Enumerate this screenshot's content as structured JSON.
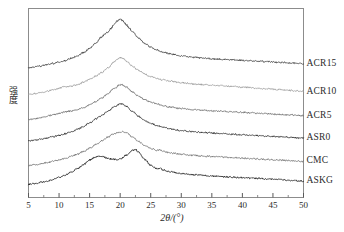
{
  "chart_data": {
    "type": "line",
    "title": "",
    "xlabel": "2θ/(°)",
    "ylabel": "强度",
    "xlim": [
      5,
      50
    ],
    "ylim": [
      0,
      100
    ],
    "grid": false,
    "legend_position": "right-of-axes-inline",
    "xticks": [
      5,
      10,
      15,
      20,
      25,
      30,
      35,
      40,
      45,
      50
    ],
    "xtick_labels": [
      "5",
      "10",
      "15",
      "20",
      "25",
      "30",
      "35",
      "40",
      "45",
      "50"
    ],
    "minor_ticks_per_interval": 1,
    "yticks": [],
    "ytick_labels": [],
    "note": "Stacked XRD diffractograms, intensity offset vertically; y-axis unlabeled (arbitrary units)",
    "series": [
      {
        "name": "ACR15",
        "color": "#3d3d3d",
        "offset": 72,
        "peak_2theta": 20.0,
        "shoulder_2theta": 17.5,
        "x": [
          5,
          6,
          7,
          8,
          9,
          10,
          11,
          12,
          13,
          14,
          15,
          16,
          17,
          17.5,
          18,
          18.5,
          19,
          19.5,
          20,
          20.5,
          21,
          21.5,
          22,
          23,
          24,
          25,
          26,
          27,
          28,
          30,
          32,
          34,
          36,
          38,
          40,
          42,
          44,
          46,
          48,
          50
        ],
        "values": [
          4,
          4.6,
          5.2,
          6,
          6.8,
          7.6,
          8.6,
          10,
          11.6,
          13.6,
          16.2,
          19.5,
          23.4,
          25.2,
          26.6,
          28.6,
          31.2,
          33.4,
          34.6,
          33.2,
          31,
          28.8,
          26.6,
          22.6,
          19.4,
          17,
          15.2,
          13.9,
          12.9,
          11.5,
          10.6,
          10,
          9.5,
          9.1,
          8.7,
          8.3,
          7.9,
          7.5,
          7.1,
          6.6
        ]
      },
      {
        "name": "ACR10",
        "color": "#9a9a9a",
        "offset": 56,
        "peak_2theta": 20.0,
        "shoulder_2theta": 10.8,
        "x": [
          5,
          6,
          7,
          8,
          9,
          10,
          10.8,
          11.5,
          12,
          13,
          14,
          15,
          16,
          17,
          18,
          19,
          19.5,
          20,
          20.5,
          21,
          22,
          23,
          24,
          25,
          26,
          27,
          28,
          30,
          32,
          34,
          36,
          38,
          40,
          42,
          44,
          46,
          48,
          50
        ],
        "values": [
          3.4,
          4,
          4.6,
          5.4,
          6.2,
          7.2,
          8.2,
          8.4,
          8.6,
          9.6,
          11,
          12.8,
          14.8,
          17.2,
          20,
          23.6,
          25.4,
          26.6,
          25.8,
          24.2,
          21,
          18.4,
          16.2,
          14.6,
          13.4,
          12.5,
          11.8,
          10.8,
          10,
          9.4,
          8.9,
          8.4,
          7.9,
          7.4,
          6.9,
          6.4,
          5.9,
          5.3
        ]
      },
      {
        "name": "ACR5",
        "color": "#6b6b6b",
        "offset": 40,
        "peak_2theta": 20.2,
        "shoulder_2theta": 11.0,
        "x": [
          5,
          6,
          7,
          8,
          9,
          10,
          11,
          11.5,
          12,
          13,
          14,
          15,
          16,
          17,
          18,
          19,
          20,
          20.2,
          21,
          22,
          23,
          24,
          25,
          26,
          27,
          28,
          30,
          32,
          34,
          36,
          38,
          40,
          42,
          44,
          46,
          48,
          50
        ],
        "values": [
          3.6,
          4.2,
          4.9,
          5.7,
          6.6,
          7.6,
          8.6,
          8.8,
          9,
          9.9,
          11.2,
          12.8,
          14.8,
          17.2,
          20,
          23.2,
          25.4,
          25.6,
          24,
          21,
          18.4,
          16.2,
          14.6,
          13.4,
          12.4,
          11.6,
          10.6,
          9.9,
          9.4,
          9,
          8.6,
          8.2,
          7.8,
          7.4,
          7,
          6.6,
          6.1
        ]
      },
      {
        "name": "ASR0",
        "color": "#2e2e2e",
        "offset": 26,
        "peak_2theta": 20.4,
        "shoulder_2theta": 16.5,
        "x": [
          5,
          6,
          7,
          8,
          9,
          10,
          11,
          12,
          13,
          14,
          15,
          16,
          16.5,
          17,
          18,
          19,
          20,
          20.4,
          21,
          22,
          23,
          24,
          25,
          26,
          27,
          28,
          30,
          32,
          34,
          36,
          38,
          40,
          42,
          44,
          46,
          48,
          50
        ],
        "values": [
          4.2,
          4.8,
          5.4,
          6.2,
          7,
          7.9,
          8.9,
          10.1,
          11.6,
          13.4,
          15.6,
          18,
          19.2,
          20.4,
          23,
          25.6,
          27.4,
          27.6,
          26,
          22.8,
          19.8,
          17.2,
          15.4,
          14,
          12.9,
          12,
          10.9,
          10.1,
          9.5,
          9,
          8.6,
          8.2,
          7.8,
          7.4,
          7,
          6.6,
          6.1
        ]
      },
      {
        "name": "CMC",
        "color": "#707070",
        "offset": 12,
        "peak_2theta": 20.6,
        "shoulder_2theta": 16.0,
        "x": [
          5,
          6,
          7,
          8,
          9,
          10,
          11,
          12,
          13,
          14,
          15,
          16,
          17,
          18,
          19,
          20,
          20.6,
          21,
          22,
          23,
          24,
          25,
          26,
          26.5,
          27,
          28,
          30,
          32,
          34,
          36,
          38,
          40,
          42,
          44,
          46,
          48,
          50
        ],
        "values": [
          3,
          3.5,
          4.1,
          4.8,
          5.6,
          6.5,
          7.5,
          8.7,
          10.1,
          11.8,
          13.8,
          16,
          18.4,
          20.8,
          22.8,
          24,
          24.2,
          23.4,
          20.8,
          18,
          15.6,
          13.8,
          12.4,
          12.8,
          11.8,
          11,
          10,
          9.3,
          8.8,
          8.4,
          8,
          7.6,
          7.2,
          6.8,
          6.4,
          6,
          5.5
        ]
      },
      {
        "name": "ASKG",
        "color": "#1f1f1f",
        "offset": 0,
        "peak_2theta": 22.5,
        "second_peak_2theta": 16.5,
        "x": [
          5,
          6,
          7,
          8,
          9,
          10,
          11,
          12,
          13,
          14,
          15,
          16,
          16.5,
          17,
          18,
          19,
          19.5,
          20,
          21,
          22,
          22.5,
          23,
          24,
          25,
          26,
          26.5,
          27,
          28,
          30,
          32,
          34,
          36,
          38,
          40,
          42,
          44,
          46,
          48,
          50
        ],
        "values": [
          3.2,
          3.8,
          4.5,
          5.3,
          6.3,
          7.5,
          9,
          10.8,
          13,
          15.6,
          18.4,
          20.4,
          21,
          20.6,
          19.4,
          18.8,
          18.6,
          19,
          21.4,
          24.4,
          25.2,
          23.4,
          18.8,
          15.2,
          13,
          13.4,
          12.2,
          11.2,
          10,
          9.3,
          8.7,
          8.2,
          7.8,
          7.4,
          7,
          6.6,
          6.2,
          5.8,
          5.2
        ]
      }
    ]
  },
  "axes": {
    "x_axis_name": "2theta-axis",
    "y_axis_name": "intensity-axis"
  }
}
